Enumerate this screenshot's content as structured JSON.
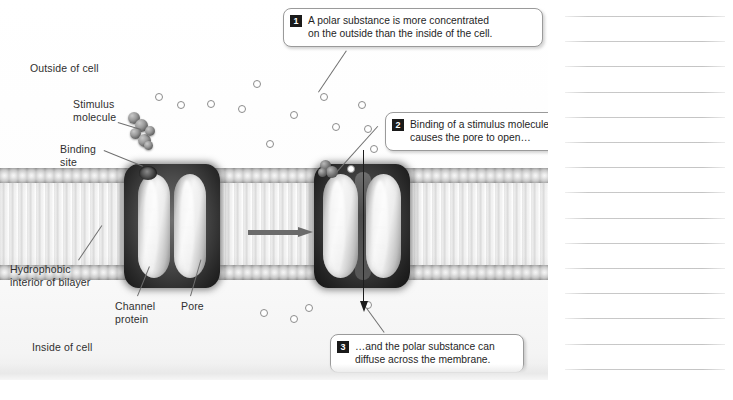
{
  "figure": {
    "labels": [
      {
        "id": "outside-of-cell",
        "text": "Outside of cell",
        "x": 30,
        "y": 62
      },
      {
        "id": "stimulus-molecule",
        "text": "Stimulus\nmolecule",
        "x": 73,
        "y": 98
      },
      {
        "id": "binding-site",
        "text": "Binding\nsite",
        "x": 60,
        "y": 143
      },
      {
        "id": "hydrophobic-interior",
        "text": "Hydrophobic\ninterior of bilayer",
        "x": 10,
        "y": 263
      },
      {
        "id": "channel-protein",
        "text": "Channel\nprotein",
        "x": 115,
        "y": 300
      },
      {
        "id": "pore",
        "text": "Pore",
        "x": 181,
        "y": 300
      },
      {
        "id": "inside-of-cell",
        "text": "Inside of cell",
        "x": 32,
        "y": 341
      }
    ],
    "callouts": [
      {
        "number": "1",
        "text": "A polar substance is more concentrated\non the outside than the inside of the cell.",
        "x": 283,
        "y": 8,
        "w": 244
      },
      {
        "number": "2",
        "text": "Binding of a stimulus molecule\ncauses the pore to open…",
        "x": 385,
        "y": 112,
        "w": 185
      },
      {
        "number": "3",
        "text": "…and the polar substance can\ndiffuse across the membrane.",
        "x": 330,
        "y": 334,
        "w": 178
      }
    ],
    "polar_substance_dots": [
      {
        "x": 155,
        "y": 93
      },
      {
        "x": 177,
        "y": 101
      },
      {
        "x": 207,
        "y": 100
      },
      {
        "x": 238,
        "y": 105
      },
      {
        "x": 253,
        "y": 80
      },
      {
        "x": 266,
        "y": 140
      },
      {
        "x": 290,
        "y": 111
      },
      {
        "x": 320,
        "y": 93
      },
      {
        "x": 332,
        "y": 123
      },
      {
        "x": 347,
        "y": 165
      },
      {
        "x": 358,
        "y": 101
      },
      {
        "x": 364,
        "y": 125
      },
      {
        "x": 370,
        "y": 145
      },
      {
        "x": 260,
        "y": 309
      },
      {
        "x": 290,
        "y": 315
      },
      {
        "x": 305,
        "y": 304
      },
      {
        "x": 364,
        "y": 301
      }
    ],
    "arrows": [
      {
        "id": "conformation-change-arrow",
        "orientation": "horizontal",
        "x": 248,
        "y": 228
      },
      {
        "id": "diffusion-arrow",
        "orientation": "vertical",
        "x": 359,
        "y": 150
      }
    ],
    "channels": [
      {
        "id": "channel-closed",
        "state": "closed",
        "x": 124,
        "y": 164
      },
      {
        "id": "channel-open",
        "state": "open",
        "x": 314,
        "y": 164
      }
    ],
    "colors": {
      "panel_background": "#fdfdfd",
      "membrane_head": "#d2d2d2",
      "protein_dark": "#2a2a2a",
      "protein_light": "#f6f6f6",
      "dot_stroke": "#8c8c8c",
      "callout_border": "#9a9a9a",
      "callout_badge": "#1a1a1a",
      "text": "#1f1f1f",
      "note_rule": "#c4c4c4"
    }
  },
  "notes": {
    "line_count": 15,
    "first_line_y": 16,
    "line_spacing": 25.2
  }
}
